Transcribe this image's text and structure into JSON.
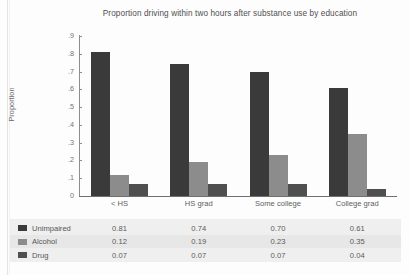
{
  "chart_data": {
    "type": "bar",
    "title": "Proportion driving within two hours after substance use by education",
    "xlabel": "",
    "ylabel": "Proportion",
    "categories": [
      "< HS",
      "HS grad",
      "Some college",
      "College grad"
    ],
    "series": [
      {
        "name": "Unimpaired",
        "color": "#3a3a3a",
        "values": [
          0.81,
          0.74,
          0.7,
          0.61
        ]
      },
      {
        "name": "Alcohol",
        "color": "#8c8c8c",
        "values": [
          0.12,
          0.19,
          0.23,
          0.35
        ]
      },
      {
        "name": "Drug",
        "color": "#4f4f4f",
        "values": [
          0.07,
          0.07,
          0.07,
          0.04
        ]
      }
    ],
    "ylim": [
      0,
      0.9
    ],
    "ytick_labels": [
      "0",
      ".1",
      ".2",
      ".3",
      ".4",
      ".5",
      ".6",
      ".7",
      ".8",
      ".9"
    ],
    "ytick_values": [
      0,
      0.1,
      0.2,
      0.3,
      0.4,
      0.5,
      0.6,
      0.7,
      0.8,
      0.9
    ],
    "grid": false,
    "legend_position": "bottom-table",
    "value_labels": [
      [
        "0.81",
        "0.74",
        "0.70",
        "0.61"
      ],
      [
        "0.12",
        "0.19",
        "0.23",
        "0.35"
      ],
      [
        "0.07",
        "0.07",
        "0.07",
        "0.04"
      ]
    ]
  }
}
